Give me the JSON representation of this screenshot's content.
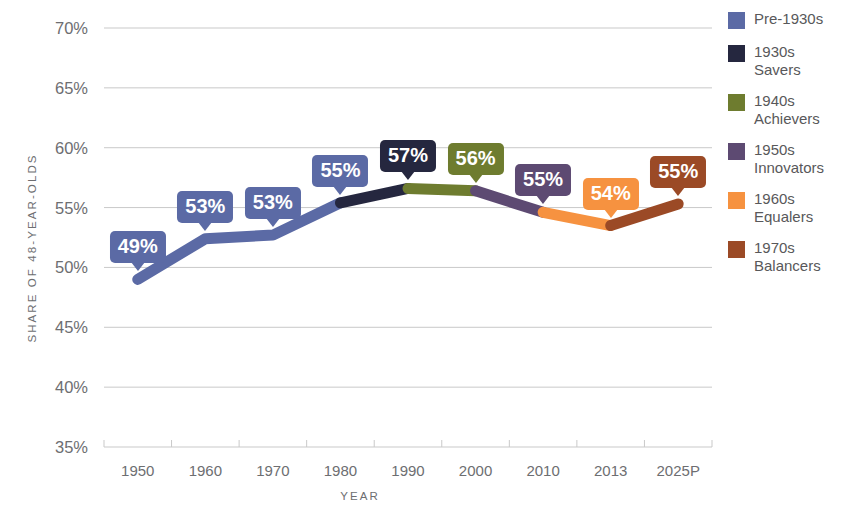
{
  "chart_data": {
    "type": "line",
    "title": "",
    "subtitle": "",
    "xlabel": "YEAR",
    "ylabel": "SHARE OF 48-YEAR-OLDS",
    "categories": [
      "1950",
      "1960",
      "1970",
      "1980",
      "1990",
      "2000",
      "2010",
      "2013",
      "2025P"
    ],
    "x_tick_labels": [
      "1950",
      "1960",
      "1970",
      "1980",
      "1990",
      "2000",
      "2010",
      "2013",
      "2025P"
    ],
    "y_tick_labels": [
      "70%",
      "65%",
      "60%",
      "55%",
      "50%",
      "45%",
      "40%",
      "35%"
    ],
    "y_tick_values": [
      70,
      65,
      60,
      55,
      50,
      45,
      40,
      35
    ],
    "ylim": [
      35,
      70
    ],
    "grid": "horizontal",
    "legend_position": "right",
    "values": [
      49,
      52.4,
      52.7,
      55.4,
      56.6,
      56.4,
      54.6,
      53.5,
      55.3
    ],
    "series": [
      {
        "name": "Pre-1930s",
        "color": "#5b6aa5",
        "points": [
          {
            "x": "1950",
            "y": 49
          },
          {
            "x": "1960",
            "y": 52.4
          },
          {
            "x": "1970",
            "y": 52.7
          },
          {
            "x": "1980",
            "y": 55.4
          }
        ]
      },
      {
        "name": "1930s Savers",
        "color": "#25273f",
        "points": [
          {
            "x": "1980",
            "y": 55.4
          },
          {
            "x": "1990",
            "y": 56.6
          }
        ]
      },
      {
        "name": "1940s Achievers",
        "color": "#6e7c2f",
        "points": [
          {
            "x": "1990",
            "y": 56.6
          },
          {
            "x": "2000",
            "y": 56.4
          }
        ]
      },
      {
        "name": "1950s Innovators",
        "color": "#5d4a72",
        "points": [
          {
            "x": "2000",
            "y": 56.4
          },
          {
            "x": "2010",
            "y": 54.6
          }
        ]
      },
      {
        "name": "1960s Equalers",
        "color": "#f69240",
        "points": [
          {
            "x": "2010",
            "y": 54.6
          },
          {
            "x": "2013",
            "y": 53.5
          }
        ]
      },
      {
        "name": "1970s Balancers",
        "color": "#9b4a26",
        "points": [
          {
            "x": "2013",
            "y": 53.5
          },
          {
            "x": "2025P",
            "y": 55.3
          }
        ]
      }
    ],
    "data_labels": [
      {
        "text": "49%",
        "x": "1950",
        "y": 49,
        "color": "#5b6aa5"
      },
      {
        "text": "53%",
        "x": "1960",
        "y": 52.4,
        "color": "#5b6aa5"
      },
      {
        "text": "53%",
        "x": "1970",
        "y": 52.7,
        "color": "#5b6aa5"
      },
      {
        "text": "55%",
        "x": "1980",
        "y": 55.4,
        "color": "#5b6aa5"
      },
      {
        "text": "57%",
        "x": "1990",
        "y": 56.6,
        "color": "#25273f"
      },
      {
        "text": "56%",
        "x": "2000",
        "y": 56.4,
        "color": "#6e7c2f"
      },
      {
        "text": "55%",
        "x": "2010",
        "y": 54.6,
        "color": "#5d4a72"
      },
      {
        "text": "54%",
        "x": "2013",
        "y": 53.5,
        "color": "#f69240"
      },
      {
        "text": "55%",
        "x": "2025P",
        "y": 55.3,
        "color": "#9b4a26"
      }
    ]
  },
  "legend": {
    "items": [
      {
        "label": "Pre-1930s",
        "color": "#5b6aa5"
      },
      {
        "label": "1930s\nSavers",
        "color": "#25273f"
      },
      {
        "label": "1940s\nAchievers",
        "color": "#6e7c2f"
      },
      {
        "label": "1950s\nInnovators",
        "color": "#5d4a72"
      },
      {
        "label": "1960s\nEqualers",
        "color": "#f69240"
      },
      {
        "label": "1970s\nBalancers",
        "color": "#9b4a26"
      }
    ]
  },
  "axes": {
    "y_title": "SHARE OF 48-YEAR-OLDS",
    "x_title": "YEAR"
  },
  "colors": {
    "grid": "#c9c9c9",
    "axis_text": "#6d6e71",
    "background": "#ffffff"
  }
}
